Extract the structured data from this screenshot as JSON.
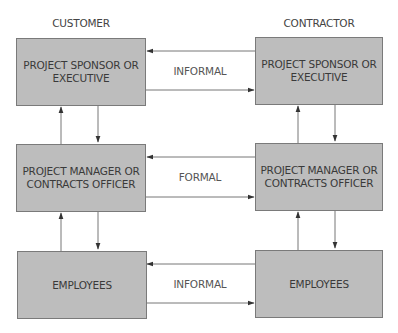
{
  "columns": {
    "left": "CUSTOMER",
    "right": "CONTRACTOR"
  },
  "rows": [
    {
      "left_box": [
        "PROJECT SPONSOR OR",
        "EXECUTIVE"
      ],
      "right_box": [
        "PROJECT SPONSOR OR",
        "EXECUTIVE"
      ],
      "link_label": "INFORMAL"
    },
    {
      "left_box": [
        "PROJECT MANAGER OR",
        "CONTRACTS OFFICER"
      ],
      "right_box": [
        "PROJECT MANAGER OR",
        "CONTRACTS OFFICER"
      ],
      "link_label": "FORMAL"
    },
    {
      "left_box": [
        "EMPLOYEES"
      ],
      "right_box": [
        "EMPLOYEES"
      ],
      "link_label": "INFORMAL"
    }
  ],
  "colors": {
    "box_fill": "#bdbdbd",
    "box_border": "#7a7a7a",
    "arrow": "#555555",
    "text": "#3a3a3a"
  }
}
